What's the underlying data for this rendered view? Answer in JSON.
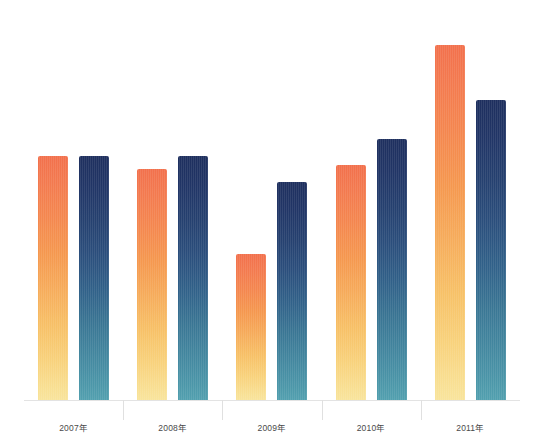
{
  "chart": {
    "type": "bar",
    "title": "",
    "subtitle": "",
    "xlabel": "",
    "ylabel": "",
    "unit_suffix": "億ドル",
    "baseline_value": 0,
    "max_value": 83,
    "grid": false,
    "legend_position": "none",
    "colors": {
      "series_a_top": "#F2704C",
      "series_a_bottom": "#F8E49C",
      "series_b_top": "#1E2F5E",
      "series_b_bottom": "#52A0AF",
      "axis_line": "#E3E3E3",
      "label_text": "#3B3B3B",
      "background": "#FFFFFF"
    }
  },
  "chart_data": {
    "type": "bar",
    "title": "",
    "xlabel": "",
    "ylabel": "",
    "ylim": [
      0,
      90
    ],
    "grid": false,
    "legend_position": "none",
    "categories": [
      "2007年",
      "2008年",
      "2009年",
      "2010年",
      "2011年"
    ],
    "series": [
      {
        "name": "series-a",
        "color": "#F2704C",
        "values": [
          57,
          54,
          34,
          55,
          83
        ],
        "labels": [
          "57億ドル",
          "54億ドル",
          "34億ドル",
          "55億ドル",
          "83億ドル"
        ]
      },
      {
        "name": "series-b",
        "color": "#1E2F5E",
        "values": [
          57,
          57,
          51,
          61,
          70
        ],
        "labels": [
          "57億ドル",
          "57億ドル",
          "51億ドル",
          "61億ドル",
          "70億ドル"
        ]
      }
    ]
  },
  "groups": [
    {
      "axis_label": "2007年",
      "bars": [
        {
          "name": "bar-2007-a",
          "style": "orange",
          "value": 57,
          "label": "57億ドル"
        },
        {
          "name": "bar-2007-b",
          "style": "blue",
          "value": 57,
          "label": "57億ドル"
        }
      ]
    },
    {
      "axis_label": "2008年",
      "bars": [
        {
          "name": "bar-2008-a",
          "style": "orange",
          "value": 54,
          "label": "54億ドル"
        },
        {
          "name": "bar-2008-b",
          "style": "blue",
          "value": 57,
          "label": "57億ドル"
        }
      ]
    },
    {
      "axis_label": "2009年",
      "bars": [
        {
          "name": "bar-2009-a",
          "style": "orange",
          "value": 34,
          "label": "34億ドル"
        },
        {
          "name": "bar-2009-b",
          "style": "blue",
          "value": 51,
          "label": "51億ドル"
        }
      ]
    },
    {
      "axis_label": "2010年",
      "bars": [
        {
          "name": "bar-2010-a",
          "style": "orange",
          "value": 55,
          "label": "55億ドル"
        },
        {
          "name": "bar-2010-b",
          "style": "blue",
          "value": 61,
          "label": "61億ドル"
        }
      ]
    },
    {
      "axis_label": "2011年",
      "bars": [
        {
          "name": "bar-2011-a",
          "style": "orange",
          "value": 83,
          "label": "83億ドル"
        },
        {
          "name": "bar-2011-b",
          "style": "blue",
          "value": 70,
          "label": "70億ドル"
        }
      ]
    }
  ],
  "layout": {
    "plot_height_px": 400,
    "px_per_unit": 4.28,
    "bar_width_px": 30,
    "bar_gap_px": 11,
    "group_width_px": 99.2
  }
}
